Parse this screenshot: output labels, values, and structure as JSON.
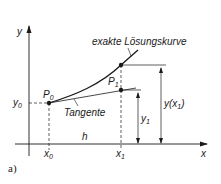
{
  "figure": {
    "panel_label": "a)",
    "axes": {
      "x_label": "x",
      "y_label": "y"
    },
    "curve_label": "exakte Lösungskurve",
    "tangent_label": "Tangente",
    "points": {
      "p0": {
        "name": "P",
        "sub": "0"
      },
      "p1": {
        "name": "P",
        "sub": "1"
      }
    },
    "ticks": {
      "x0": {
        "name": "x",
        "sub": "0"
      },
      "x1": {
        "name": "x",
        "sub": "1"
      },
      "y0": {
        "name": "y",
        "sub": "0"
      }
    },
    "step_label": "h",
    "dimension_labels": {
      "y1": {
        "name": "y",
        "sub": "1"
      },
      "y_x1": {
        "pre": "y(x",
        "sub": "1",
        "post": ")"
      }
    },
    "colors": {
      "line": "#1a1a1a",
      "background": "#ffffff"
    }
  }
}
